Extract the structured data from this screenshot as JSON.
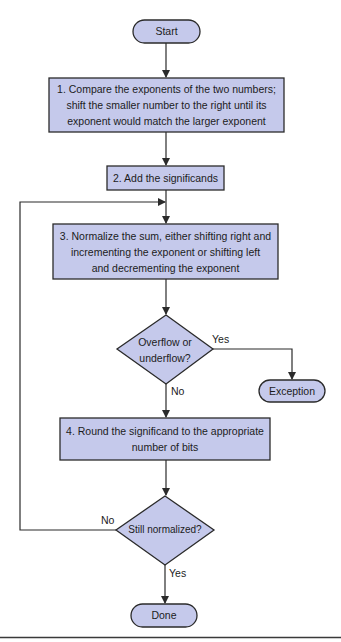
{
  "diagram": {
    "type": "flowchart",
    "colors": {
      "node_fill": "#c5c9eb",
      "stroke": "#2b2b2b",
      "background": "#ffffff"
    },
    "nodes": {
      "start": {
        "label": "Start",
        "shape": "terminal"
      },
      "step1": {
        "label": "1.  Compare the exponents of the two numbers; shift the smaller number to the right until its exponent would match the larger exponent",
        "lines": [
          "1.  Compare the exponents of the two numbers;",
          "shift the smaller number to the right until its",
          "exponent would match the larger exponent"
        ],
        "shape": "process"
      },
      "step2": {
        "label": "2. Add the significands",
        "shape": "process"
      },
      "step3": {
        "label": "3. Normalize the sum, either shifting right and incrementing the exponent or shifting left and decrementing the exponent",
        "lines": [
          "3. Normalize the sum, either shifting right and",
          "incrementing the exponent or shifting left",
          "and decrementing the exponent"
        ],
        "shape": "process"
      },
      "decision1": {
        "label": "Overflow or underflow?",
        "lines": [
          "Overflow or",
          "underflow?"
        ],
        "shape": "decision"
      },
      "exception": {
        "label": "Exception",
        "shape": "terminal"
      },
      "step4": {
        "label": "4. Round the significand to the appropriate number of bits",
        "lines": [
          "4. Round the significand to the appropriate",
          "number of bits"
        ],
        "shape": "process"
      },
      "decision2": {
        "label": "Still normalized?",
        "shape": "decision"
      },
      "done": {
        "label": "Done",
        "shape": "terminal"
      }
    },
    "edges": {
      "d1_yes": "Yes",
      "d1_no": "No",
      "d2_no": "No",
      "d2_yes": "Yes"
    },
    "edge_list": [
      {
        "from": "start",
        "to": "step1"
      },
      {
        "from": "step1",
        "to": "step2"
      },
      {
        "from": "step2",
        "to": "step3"
      },
      {
        "from": "step3",
        "to": "decision1"
      },
      {
        "from": "decision1",
        "to": "exception",
        "label": "Yes"
      },
      {
        "from": "decision1",
        "to": "step4",
        "label": "No"
      },
      {
        "from": "step4",
        "to": "decision2"
      },
      {
        "from": "decision2",
        "to": "step3",
        "label": "No"
      },
      {
        "from": "decision2",
        "to": "done",
        "label": "Yes"
      }
    ]
  }
}
